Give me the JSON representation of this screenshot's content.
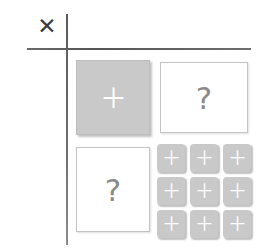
{
  "canvas": {
    "width": 262,
    "height": 252,
    "background_color": "#ffffff"
  },
  "axis": {
    "vertical_line_color": "#6f6f6f",
    "horizontal_line_color": "#5d5d5d",
    "corner_mark": {
      "glyph": "✕",
      "name": "x-mark",
      "color": "#3b3b3b"
    }
  },
  "cells": {
    "top_left": {
      "style": "filled",
      "fill_color": "#c9c9c9",
      "glyph": "＋",
      "glyph_color": "#ffffff",
      "label": "plus"
    },
    "top_right": {
      "style": "outline",
      "fill_color": "#ffffff",
      "border_color": "#c4c4c4",
      "glyph": "?",
      "glyph_color": "#8a8a8a",
      "label": "question"
    },
    "bottom_left": {
      "style": "outline",
      "fill_color": "#ffffff",
      "border_color": "#c4c4c4",
      "glyph": "?",
      "glyph_color": "#8a8a8a",
      "label": "question"
    },
    "bottom_right": {
      "style": "grid",
      "rows": 3,
      "columns": 3,
      "tile_fill_color": "#c9c9c9",
      "tile_glyph": "＋",
      "tile_glyph_color": "#ffffff",
      "tiles": [
        {
          "glyph": "＋"
        },
        {
          "glyph": "＋"
        },
        {
          "glyph": "＋"
        },
        {
          "glyph": "＋"
        },
        {
          "glyph": "＋"
        },
        {
          "glyph": "＋"
        },
        {
          "glyph": "＋"
        },
        {
          "glyph": "＋"
        },
        {
          "glyph": "＋"
        }
      ]
    }
  }
}
